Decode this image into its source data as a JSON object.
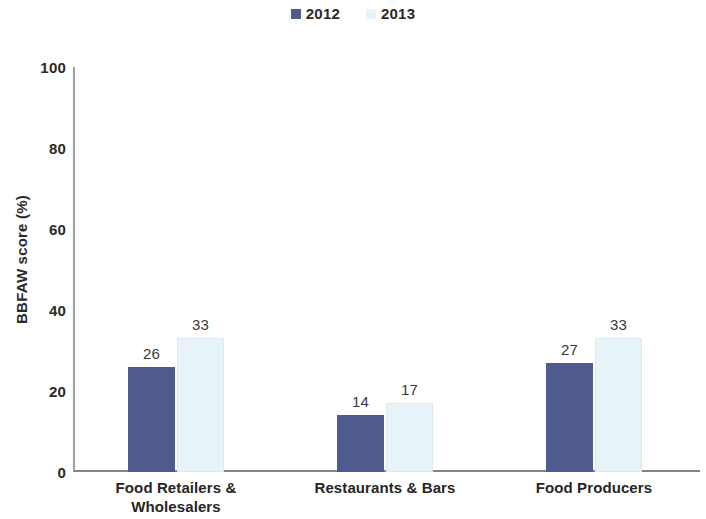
{
  "chart_data": {
    "type": "bar",
    "title": "",
    "subtitle": "",
    "xlabel": "",
    "ylabel": "BBFAW score (%)",
    "ylim": [
      0,
      100
    ],
    "yticks": [
      "0",
      "20",
      "40",
      "60",
      "80",
      "100"
    ],
    "grid": false,
    "legend_position": "top-center",
    "categories": [
      "Food Retailers & Wholesalers",
      "Restaurants & Bars",
      "Food Producers"
    ],
    "category_lines": [
      [
        "Food Retailers &",
        "Wholesalers"
      ],
      [
        "Restaurants & Bars"
      ],
      [
        "Food Producers"
      ]
    ],
    "series": [
      {
        "name": "2012",
        "color": "#4f5b8e",
        "values": [
          26,
          14,
          27
        ],
        "labels": [
          "26",
          "14",
          "27"
        ]
      },
      {
        "name": "2013",
        "color": "#e6f3f8",
        "values": [
          33,
          17,
          33
        ],
        "labels": [
          "33",
          "17",
          "33"
        ]
      }
    ]
  },
  "legend": {
    "items": [
      {
        "label": "2012",
        "color": "#4f5b8e"
      },
      {
        "label": "2013",
        "color": "#e6f3f8"
      }
    ]
  },
  "axis": {
    "y_title": "BBFAW score (%)",
    "y_ticks": [
      "100",
      "80",
      "60",
      "40",
      "20",
      "0"
    ]
  }
}
